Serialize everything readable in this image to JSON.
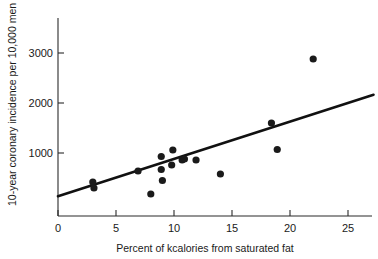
{
  "chart_data": {
    "type": "scatter",
    "title": "",
    "xlabel": "Percent of kcalories from saturated fat",
    "ylabel": "10-year coronary incidence per 10,000 men",
    "xlim": [
      0,
      27.5
    ],
    "ylim": [
      -270,
      3450
    ],
    "xticks": [
      0,
      5,
      10,
      15,
      20,
      25
    ],
    "xtick_labels": [
      "0",
      "5",
      "10",
      "15",
      "20",
      "25"
    ],
    "yticks": [
      1000,
      2000,
      3000
    ],
    "ytick_labels": [
      "1000",
      "2000",
      "3000"
    ],
    "grid": false,
    "legend": null,
    "point_color": "#1a1a1a",
    "line_color": "#111111",
    "x": [
      3.0,
      3.1,
      6.9,
      8.0,
      8.9,
      8.9,
      9.0,
      9.8,
      9.9,
      10.7,
      10.9,
      11.9,
      14.0,
      18.4,
      18.9,
      22.0
    ],
    "y": [
      420,
      300,
      640,
      180,
      930,
      670,
      450,
      760,
      1060,
      860,
      880,
      860,
      580,
      1600,
      1070,
      2880
    ],
    "series": [
      {
        "name": "countries",
        "points": [
          {
            "x": 3.0,
            "y": 420
          },
          {
            "x": 3.1,
            "y": 300
          },
          {
            "x": 6.9,
            "y": 640
          },
          {
            "x": 8.0,
            "y": 180
          },
          {
            "x": 8.9,
            "y": 930
          },
          {
            "x": 8.9,
            "y": 670
          },
          {
            "x": 9.0,
            "y": 450
          },
          {
            "x": 9.8,
            "y": 760
          },
          {
            "x": 9.9,
            "y": 1060
          },
          {
            "x": 10.7,
            "y": 860
          },
          {
            "x": 10.9,
            "y": 880
          },
          {
            "x": 11.9,
            "y": 860
          },
          {
            "x": 14.0,
            "y": 580
          },
          {
            "x": 18.4,
            "y": 1600
          },
          {
            "x": 18.9,
            "y": 1070
          },
          {
            "x": 22.0,
            "y": 2880
          }
        ]
      }
    ],
    "fit_line": {
      "type": "linear-regression",
      "x_start": 0.0,
      "y_start": 135,
      "x_end": 27.2,
      "y_end": 2165
    }
  }
}
